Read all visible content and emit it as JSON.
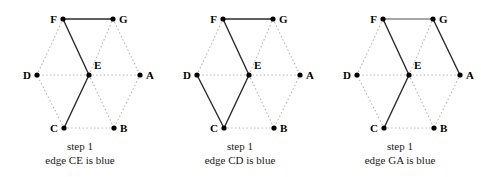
{
  "figure": {
    "background_color": "#ffffff",
    "dotted_edge_color": "#b5b5b5",
    "solid_edge_color": "#2b2b2b",
    "highlight_edge_color": "#8a8a8a",
    "vertex_color": "#000000"
  },
  "vertex_labels": {
    "A": "A",
    "B": "B",
    "C": "C",
    "D": "D",
    "E": "E",
    "F": "F",
    "G": "G"
  },
  "panels": [
    {
      "id": "panel-1",
      "caption_step": "step 1",
      "caption_edge": "edge CE is blue"
    },
    {
      "id": "panel-2",
      "caption_step": "step 1",
      "caption_edge": "edge CD is blue"
    },
    {
      "id": "panel-3",
      "caption_step": "step 1",
      "caption_edge": "edge GA is blue"
    }
  ],
  "chart_data": {
    "type": "diagram",
    "title": "",
    "vertices": [
      {
        "name": "F",
        "x": 63,
        "y": 19,
        "label_pos": "left"
      },
      {
        "name": "G",
        "x": 113,
        "y": 19,
        "label_pos": "right"
      },
      {
        "name": "D",
        "x": 37,
        "y": 75,
        "label_pos": "left"
      },
      {
        "name": "E",
        "x": 89,
        "y": 75,
        "label_pos": "upright"
      },
      {
        "name": "A",
        "x": 140,
        "y": 75,
        "label_pos": "right"
      },
      {
        "name": "C",
        "x": 64,
        "y": 128,
        "label_pos": "left"
      },
      {
        "name": "B",
        "x": 114,
        "y": 128,
        "label_pos": "right"
      }
    ],
    "dotted_edges": [
      [
        "D",
        "F"
      ],
      [
        "F",
        "G"
      ],
      [
        "G",
        "A"
      ],
      [
        "A",
        "B"
      ],
      [
        "B",
        "C"
      ],
      [
        "C",
        "D"
      ],
      [
        "E",
        "F"
      ],
      [
        "E",
        "G"
      ],
      [
        "E",
        "A"
      ],
      [
        "E",
        "B"
      ],
      [
        "E",
        "C"
      ],
      [
        "E",
        "D"
      ]
    ],
    "panel_solid_edges": [
      [
        [
          "F",
          "G"
        ],
        [
          "F",
          "E"
        ],
        [
          "E",
          "C"
        ]
      ],
      [
        [
          "F",
          "G"
        ],
        [
          "F",
          "E"
        ],
        [
          "E",
          "C"
        ],
        [
          "C",
          "D"
        ]
      ],
      [
        [
          "F",
          "E"
        ],
        [
          "E",
          "C"
        ],
        [
          "G",
          "A"
        ]
      ]
    ],
    "panel_highlight_edges": [
      [],
      [],
      [
        [
          "F",
          "G"
        ]
      ]
    ]
  }
}
